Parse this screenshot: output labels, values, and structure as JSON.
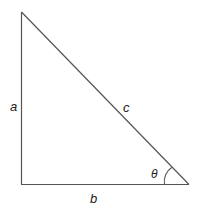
{
  "diagram": {
    "type": "right-triangle",
    "labels": {
      "side_vertical": "a",
      "side_horizontal": "b",
      "hypotenuse": "c",
      "angle": "θ"
    },
    "colors": {
      "stroke": "#555555",
      "text": "#222222"
    }
  }
}
